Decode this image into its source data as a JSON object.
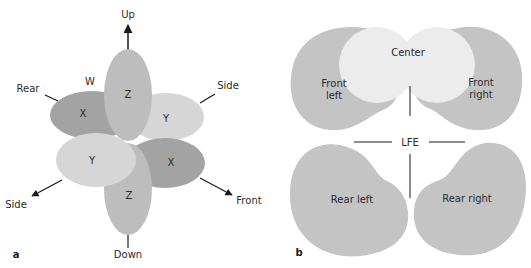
{
  "figure": {
    "panel_a": {
      "label": "a",
      "directions": {
        "up": "Up",
        "down": "Down",
        "rear": "Rear",
        "front": "Front",
        "side_right": "Side",
        "side_left": "Side"
      },
      "lobes": {
        "w": "W",
        "x_rear": "X",
        "x_front": "X",
        "y_right": "Y",
        "y_left": "Y",
        "z_up": "Z",
        "z_down": "Z"
      },
      "colors": {
        "x": "#a3a3a3",
        "y": "#d6d6d6",
        "z": "#bdbdbd"
      }
    },
    "panel_b": {
      "label": "b",
      "speakers": {
        "center": "Center",
        "front_left_1": "Front",
        "front_left_2": "left",
        "front_right_1": "Front",
        "front_right_2": "right",
        "lfe": "LFE",
        "rear_left": "Rear left",
        "rear_right": "Rear right"
      },
      "colors": {
        "speaker": "#c4c4c4",
        "center": "#ececec"
      }
    }
  }
}
